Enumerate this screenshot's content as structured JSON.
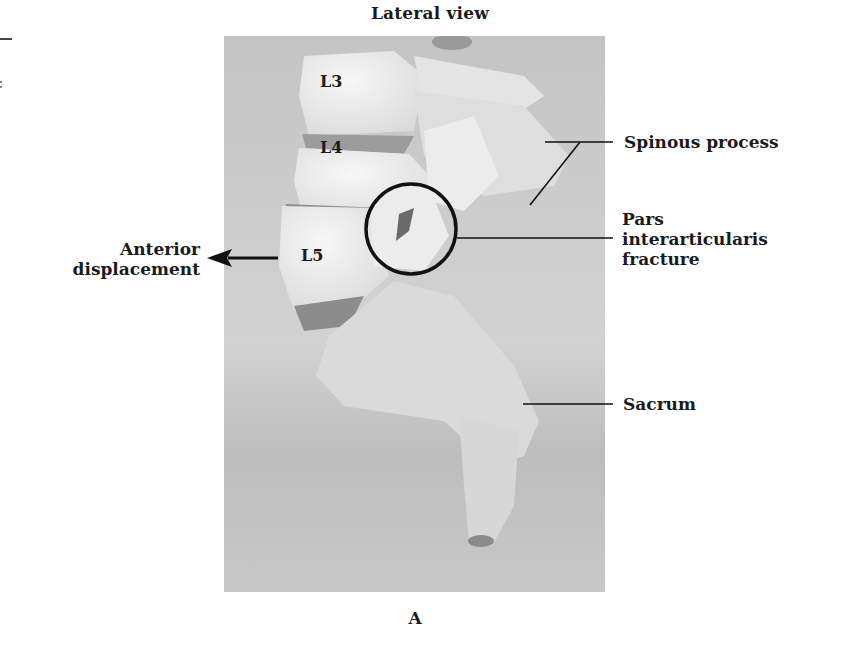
{
  "figure": {
    "title": "Lateral view",
    "caption": "A",
    "rendering_note": "Bone shapes are rough SVG approximations; the source is a grayscale photograph of a lumbar spine model that cannot be reproduced in HTML.",
    "vertebra_labels": {
      "l3": "L3",
      "l4": "L4",
      "l5": "L5"
    },
    "annotations": {
      "spinous_process": "Spinous process",
      "pars_line1": "Pars",
      "pars_line2": "interarticularis",
      "pars_line3": "fracture",
      "sacrum": "Sacrum",
      "anterior_line1": "Anterior",
      "anterior_line2": "displacement"
    },
    "colors": {
      "background": "#ffffff",
      "photo_bg": "#c9c9c9",
      "bone": "#ebebeb",
      "bone_shadow": "#a8a8a8",
      "ink": "#1a1a1a"
    }
  }
}
